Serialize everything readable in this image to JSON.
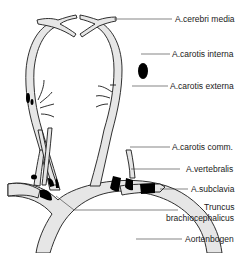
{
  "diagram": {
    "type": "anatomical",
    "colors": {
      "vessel_fill": "#e6e6e6",
      "vessel_outline": "#1a1a1a",
      "lesion_fill": "#000000",
      "leader_line": "#333333",
      "background": "#ffffff"
    },
    "labels": [
      {
        "id": "cerebri-media",
        "text": "A.cerebri media"
      },
      {
        "id": "carotis-interna",
        "text": "A.carotis interna"
      },
      {
        "id": "carotis-externa",
        "text": "A.carotis externa"
      },
      {
        "id": "carotis-comm",
        "text": "A.carotis comm."
      },
      {
        "id": "vertebralis",
        "text": "A.vertebralis"
      },
      {
        "id": "subclavia",
        "text": "A.subclavia"
      },
      {
        "id": "truncus-line1",
        "text": "Truncus"
      },
      {
        "id": "truncus-line2",
        "text": "brachiocephalicus"
      },
      {
        "id": "aortenbogen",
        "text": "Aortenbogen"
      }
    ]
  }
}
